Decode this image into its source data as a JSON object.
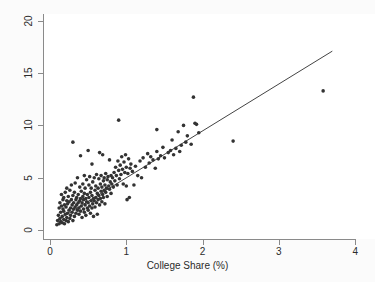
{
  "chart_data": {
    "type": "scatter",
    "title": "",
    "xlabel": "College Share (%)",
    "ylabel": "",
    "xlim": [
      0,
      4
    ],
    "ylim": [
      0,
      20
    ],
    "xticks": [
      0,
      1,
      2,
      3,
      4
    ],
    "yticks": [
      0,
      5,
      10,
      15,
      20
    ],
    "xtick_labels": [
      "0",
      "1",
      "2",
      "3",
      "4"
    ],
    "ytick_labels": [
      "0",
      "5",
      "10",
      "15",
      "20"
    ],
    "grid": false,
    "legend": "none",
    "marker_color": "#333333",
    "marker_size": 3.6,
    "background_color": "#ffffff",
    "figure_background_color": "#fbfbfb",
    "axis_color": "#8a8a8a",
    "series": [
      {
        "name": "observations",
        "marker": "filled-circle",
        "points": [
          [
            0.09,
            0.5
          ],
          [
            0.1,
            0.9
          ],
          [
            0.11,
            1.4
          ],
          [
            0.12,
            0.6
          ],
          [
            0.12,
            2.1
          ],
          [
            0.13,
            1.1
          ],
          [
            0.13,
            2.6
          ],
          [
            0.14,
            0.8
          ],
          [
            0.14,
            1.7
          ],
          [
            0.15,
            2.3
          ],
          [
            0.15,
            3.4
          ],
          [
            0.16,
            0.7
          ],
          [
            0.16,
            1.3
          ],
          [
            0.17,
            2.0
          ],
          [
            0.17,
            2.9
          ],
          [
            0.18,
            1.0
          ],
          [
            0.18,
            1.8
          ],
          [
            0.18,
            3.1
          ],
          [
            0.19,
            0.6
          ],
          [
            0.19,
            2.4
          ],
          [
            0.2,
            1.5
          ],
          [
            0.2,
            3.6
          ],
          [
            0.21,
            0.9
          ],
          [
            0.21,
            2.2
          ],
          [
            0.22,
            1.2
          ],
          [
            0.22,
            2.8
          ],
          [
            0.22,
            4.0
          ],
          [
            0.23,
            1.6
          ],
          [
            0.23,
            2.5
          ],
          [
            0.24,
            0.8
          ],
          [
            0.24,
            3.2
          ],
          [
            0.25,
            1.9
          ],
          [
            0.25,
            2.7
          ],
          [
            0.26,
            1.1
          ],
          [
            0.26,
            3.8
          ],
          [
            0.27,
            2.1
          ],
          [
            0.27,
            1.4
          ],
          [
            0.28,
            2.9
          ],
          [
            0.28,
            4.3
          ],
          [
            0.29,
            1.7
          ],
          [
            0.29,
            2.4
          ],
          [
            0.3,
            0.9
          ],
          [
            0.3,
            3.3
          ],
          [
            0.3,
            8.4
          ],
          [
            0.31,
            2.0
          ],
          [
            0.31,
            2.6
          ],
          [
            0.32,
            1.3
          ],
          [
            0.32,
            3.6
          ],
          [
            0.33,
            2.2
          ],
          [
            0.33,
            4.5
          ],
          [
            0.34,
            1.6
          ],
          [
            0.34,
            2.9
          ],
          [
            0.35,
            2.4
          ],
          [
            0.35,
            3.1
          ],
          [
            0.36,
            1.9
          ],
          [
            0.36,
            5.0
          ],
          [
            0.37,
            2.6
          ],
          [
            0.37,
            3.4
          ],
          [
            0.38,
            1.5
          ],
          [
            0.38,
            2.1
          ],
          [
            0.39,
            2.8
          ],
          [
            0.39,
            4.1
          ],
          [
            0.4,
            1.8
          ],
          [
            0.4,
            3.0
          ],
          [
            0.4,
            7.1
          ],
          [
            0.41,
            2.3
          ],
          [
            0.41,
            3.7
          ],
          [
            0.42,
            1.2
          ],
          [
            0.42,
            2.6
          ],
          [
            0.43,
            4.4
          ],
          [
            0.43,
            3.2
          ],
          [
            0.44,
            2.0
          ],
          [
            0.44,
            2.9
          ],
          [
            0.45,
            1.7
          ],
          [
            0.45,
            3.5
          ],
          [
            0.45,
            5.2
          ],
          [
            0.46,
            2.4
          ],
          [
            0.46,
            4.0
          ],
          [
            0.47,
            1.4
          ],
          [
            0.47,
            3.0
          ],
          [
            0.48,
            2.7
          ],
          [
            0.48,
            4.8
          ],
          [
            0.49,
            2.1
          ],
          [
            0.49,
            3.4
          ],
          [
            0.5,
            1.9
          ],
          [
            0.5,
            2.6
          ],
          [
            0.5,
            7.6
          ],
          [
            0.51,
            3.1
          ],
          [
            0.51,
            4.3
          ],
          [
            0.52,
            2.3
          ],
          [
            0.52,
            5.1
          ],
          [
            0.53,
            1.6
          ],
          [
            0.53,
            3.6
          ],
          [
            0.54,
            2.8
          ],
          [
            0.54,
            4.0
          ],
          [
            0.55,
            2.1
          ],
          [
            0.55,
            3.3
          ],
          [
            0.55,
            6.3
          ],
          [
            0.56,
            2.5
          ],
          [
            0.56,
            4.6
          ],
          [
            0.57,
            1.3
          ],
          [
            0.57,
            3.0
          ],
          [
            0.58,
            2.8
          ],
          [
            0.58,
            5.0
          ],
          [
            0.59,
            3.8
          ],
          [
            0.59,
            2.2
          ],
          [
            0.6,
            4.2
          ],
          [
            0.6,
            3.1
          ],
          [
            0.61,
            2.6
          ],
          [
            0.61,
            5.3
          ],
          [
            0.62,
            1.5
          ],
          [
            0.62,
            3.5
          ],
          [
            0.63,
            4.0
          ],
          [
            0.63,
            2.9
          ],
          [
            0.64,
            4.9
          ],
          [
            0.64,
            3.3
          ],
          [
            0.65,
            2.4
          ],
          [
            0.65,
            7.4
          ],
          [
            0.66,
            4.4
          ],
          [
            0.66,
            3.0
          ],
          [
            0.67,
            5.2
          ],
          [
            0.67,
            3.7
          ],
          [
            0.68,
            2.7
          ],
          [
            0.68,
            4.1
          ],
          [
            0.69,
            3.4
          ],
          [
            0.69,
            7.2
          ],
          [
            0.7,
            4.7
          ],
          [
            0.7,
            3.1
          ],
          [
            0.71,
            5.0
          ],
          [
            0.71,
            3.8
          ],
          [
            0.72,
            2.5
          ],
          [
            0.72,
            4.3
          ],
          [
            0.73,
            3.6
          ],
          [
            0.73,
            5.4
          ],
          [
            0.74,
            4.0
          ],
          [
            0.75,
            3.2
          ],
          [
            0.75,
            4.8
          ],
          [
            0.76,
            5.1
          ],
          [
            0.77,
            4.2
          ],
          [
            0.78,
            3.9
          ],
          [
            0.78,
            6.7
          ],
          [
            0.79,
            4.6
          ],
          [
            0.8,
            5.2
          ],
          [
            0.8,
            3.5
          ],
          [
            0.81,
            4.4
          ],
          [
            0.82,
            5.0
          ],
          [
            0.83,
            4.1
          ],
          [
            0.84,
            5.5
          ],
          [
            0.85,
            4.7
          ],
          [
            0.86,
            6.0
          ],
          [
            0.87,
            5.2
          ],
          [
            0.88,
            4.3
          ],
          [
            0.89,
            6.6
          ],
          [
            0.9,
            5.7
          ],
          [
            0.9,
            10.5
          ],
          [
            0.91,
            4.9
          ],
          [
            0.92,
            6.2
          ],
          [
            0.93,
            5.3
          ],
          [
            0.94,
            7.0
          ],
          [
            0.95,
            5.8
          ],
          [
            0.96,
            4.4
          ],
          [
            0.97,
            6.5
          ],
          [
            0.98,
            5.5
          ],
          [
            0.99,
            7.2
          ],
          [
            1.0,
            4.2
          ],
          [
            1.0,
            6.0
          ],
          [
            1.01,
            2.9
          ],
          [
            1.02,
            5.4
          ],
          [
            1.03,
            6.8
          ],
          [
            1.04,
            3.1
          ],
          [
            1.05,
            5.9
          ],
          [
            1.06,
            6.3
          ],
          [
            1.08,
            5.6
          ],
          [
            1.1,
            4.3
          ],
          [
            1.12,
            6.1
          ],
          [
            1.15,
            5.2
          ],
          [
            1.18,
            6.6
          ],
          [
            1.2,
            5.0
          ],
          [
            1.22,
            6.9
          ],
          [
            1.25,
            6.0
          ],
          [
            1.28,
            7.3
          ],
          [
            1.3,
            6.4
          ],
          [
            1.32,
            7.0
          ],
          [
            1.35,
            6.7
          ],
          [
            1.38,
            5.9
          ],
          [
            1.4,
            7.5
          ],
          [
            1.4,
            9.6
          ],
          [
            1.42,
            6.8
          ],
          [
            1.45,
            7.1
          ],
          [
            1.48,
            7.9
          ],
          [
            1.5,
            6.9
          ],
          [
            1.55,
            7.4
          ],
          [
            1.58,
            7.6
          ],
          [
            1.6,
            8.6
          ],
          [
            1.62,
            7.2
          ],
          [
            1.65,
            7.8
          ],
          [
            1.68,
            9.4
          ],
          [
            1.7,
            7.5
          ],
          [
            1.72,
            8.1
          ],
          [
            1.75,
            10.0
          ],
          [
            1.78,
            8.4
          ],
          [
            1.8,
            9.0
          ],
          [
            1.85,
            8.2
          ],
          [
            1.88,
            12.7
          ],
          [
            1.9,
            10.2
          ],
          [
            1.92,
            10.1
          ],
          [
            1.95,
            9.3
          ],
          [
            2.4,
            8.5
          ],
          [
            3.58,
            13.3
          ]
        ]
      }
    ],
    "fit_line": {
      "name": "linear-fit",
      "x": [
        0.1,
        3.7
      ],
      "y": [
        0.95,
        17.1
      ],
      "color": "#444444"
    }
  }
}
